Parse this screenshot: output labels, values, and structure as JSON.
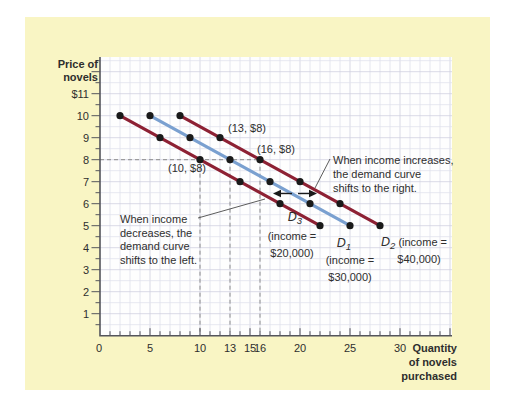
{
  "figure": {
    "colors": {
      "page_bg": "#ffffff",
      "panel_bg": "#f9f5c4",
      "plot_bg": "#fefefe",
      "grid": "#e0e1ec",
      "grid_major": "#cfd1e0",
      "axis": "#54555c",
      "dash": "#8c8c8c",
      "text": "#2e2e2e",
      "dot": "#1a1a1a",
      "maroon": "#8d2134",
      "blue": "#7aa0d0"
    }
  },
  "chart_data": {
    "type": "line",
    "title": "",
    "xlabel": "Quantity of novels purchased",
    "ylabel": "Price of novels",
    "x_axis": {
      "title_lines": [
        "Quantity",
        "of novels",
        "purchased"
      ],
      "range": [
        0,
        35
      ],
      "ticks": [
        {
          "v": 0,
          "label": "0"
        },
        {
          "v": 5,
          "label": "5"
        },
        {
          "v": 10,
          "label": "10"
        },
        {
          "v": 13,
          "label": "13"
        },
        {
          "v": 15,
          "label": "15"
        },
        {
          "v": 16,
          "label": "16"
        },
        {
          "v": 20,
          "label": "20"
        },
        {
          "v": 25,
          "label": "25"
        },
        {
          "v": 30,
          "label": "30"
        }
      ]
    },
    "y_axis": {
      "title_lines": [
        "Price of",
        "novels"
      ],
      "range": [
        0,
        12.6
      ],
      "ticks": [
        {
          "v": 11,
          "label": "$11"
        },
        {
          "v": 10,
          "label": "10"
        },
        {
          "v": 9,
          "label": "9"
        },
        {
          "v": 8,
          "label": "8"
        },
        {
          "v": 7,
          "label": "7"
        },
        {
          "v": 6,
          "label": "6"
        },
        {
          "v": 5,
          "label": "5"
        },
        {
          "v": 4,
          "label": "4"
        },
        {
          "v": 3,
          "label": "3"
        },
        {
          "v": 2,
          "label": "2"
        },
        {
          "v": 1,
          "label": "1"
        }
      ]
    },
    "guides": {
      "price": 8,
      "quantities": [
        10,
        13,
        16
      ]
    },
    "series": [
      {
        "id": "D3",
        "symbol_base": "D",
        "symbol_sub": "3",
        "symbol_suffix": "",
        "caption_lines": [
          "(income =",
          "$20,000)"
        ],
        "color_key": "maroon",
        "points": [
          [
            2,
            10
          ],
          [
            6,
            9
          ],
          [
            10,
            8
          ],
          [
            14,
            7
          ],
          [
            18,
            6
          ],
          [
            22,
            5
          ]
        ]
      },
      {
        "id": "D1",
        "symbol_base": "D",
        "symbol_sub": "1",
        "symbol_suffix": "",
        "caption_lines": [
          "(income =",
          "$30,000)"
        ],
        "color_key": "blue",
        "points": [
          [
            5,
            10
          ],
          [
            9,
            9
          ],
          [
            13,
            8
          ],
          [
            17,
            7
          ],
          [
            21,
            6
          ],
          [
            25,
            5
          ]
        ]
      },
      {
        "id": "D2",
        "symbol_base": "D",
        "symbol_sub": "2",
        "symbol_suffix": " (income =",
        "caption_lines": [
          "$40,000)"
        ],
        "color_key": "maroon",
        "points": [
          [
            8,
            10
          ],
          [
            12,
            9
          ],
          [
            16,
            8
          ],
          [
            20,
            7
          ],
          [
            24,
            6
          ],
          [
            28,
            5
          ]
        ]
      }
    ],
    "point_labels": [
      {
        "id": "p10",
        "text": "(10, $8)"
      },
      {
        "id": "p13",
        "text": "(13, $8)"
      },
      {
        "id": "p16",
        "text": "(16, $8)"
      }
    ],
    "annotations": {
      "increase_lines": [
        "When income increases,",
        "the demand curve",
        "shifts to the right."
      ],
      "decrease_lines": [
        "When income",
        "decreases, the",
        "demand curve",
        "shifts to the left."
      ]
    }
  }
}
